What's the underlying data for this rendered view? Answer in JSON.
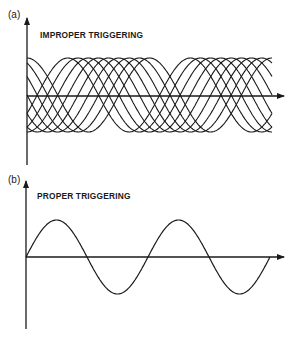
{
  "panels": [
    {
      "label": "(a)",
      "title": "IMPROPER TRIGGERING",
      "description": "Multiple overlapping sine traces with shifted phases"
    },
    {
      "label": "(b)",
      "title": "PROPER TRIGGERING",
      "description": "Single stable sine trace, two full cycles"
    }
  ],
  "chart_data": [
    {
      "type": "line",
      "title": "IMPROPER TRIGGERING",
      "xlabel": "",
      "ylabel": "",
      "grid": false,
      "series_count": 9,
      "cycles_shown": 2,
      "note": "Overlapping sine waves of equal amplitude and period, each with a different phase offset"
    },
    {
      "type": "line",
      "title": "PROPER TRIGGERING",
      "xlabel": "",
      "ylabel": "",
      "grid": false,
      "series": [
        {
          "name": "sine",
          "cycles": 2,
          "start_phase": 0
        }
      ]
    }
  ],
  "colors": {
    "ink": "#1a1a1a",
    "background": "#ffffff"
  }
}
